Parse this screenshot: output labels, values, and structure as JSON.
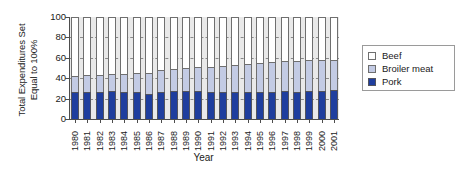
{
  "chart_data": {
    "type": "bar",
    "stacked": true,
    "title": "",
    "xlabel": "Year",
    "ylabel": "Total Expenditures Set Equal to 100%",
    "ylabel_line1": "Total Expenditures Set",
    "ylabel_line2": "Equal to 100%",
    "ylim": [
      0,
      100
    ],
    "yticks": [
      0,
      20,
      40,
      60,
      80,
      100
    ],
    "grid": true,
    "grid_style": "dashed-horizontal",
    "legend_position": "right",
    "categories": [
      "1980",
      "1981",
      "1982",
      "1983",
      "1984",
      "1985",
      "1986",
      "1987",
      "1988",
      "1989",
      "1990",
      "1991",
      "1992",
      "1993",
      "1994",
      "1995",
      "1996",
      "1997",
      "1998",
      "1999",
      "2000",
      "2001"
    ],
    "series": [
      {
        "name": "Pork",
        "color": "#1f3e9e",
        "values": [
          26,
          26,
          26,
          27,
          26,
          26,
          25,
          26,
          27,
          27,
          27,
          26,
          26,
          26,
          26,
          26,
          26,
          27,
          26,
          27,
          27,
          28
        ]
      },
      {
        "name": "Broiler meat",
        "color": "#c3cbe4",
        "values": [
          16,
          17,
          17,
          17,
          18,
          19,
          20,
          22,
          22,
          23,
          24,
          25,
          26,
          27,
          28,
          29,
          30,
          30,
          31,
          31,
          31,
          30
        ]
      },
      {
        "name": "Beef",
        "color": "#ffffff",
        "values": [
          58,
          57,
          57,
          56,
          56,
          55,
          55,
          52,
          51,
          50,
          49,
          49,
          48,
          47,
          46,
          45,
          44,
          43,
          43,
          42,
          42,
          42
        ]
      }
    ],
    "cumulative_tops": {
      "pork": [
        26,
        26,
        26,
        27,
        26,
        26,
        25,
        26,
        27,
        27,
        27,
        26,
        26,
        26,
        26,
        26,
        26,
        27,
        26,
        27,
        27,
        28
      ],
      "broiler": [
        42,
        43,
        43,
        44,
        44,
        45,
        45,
        48,
        49,
        50,
        51,
        51,
        52,
        53,
        54,
        55,
        56,
        57,
        57,
        58,
        58,
        58
      ],
      "beef": [
        100,
        100,
        100,
        100,
        100,
        100,
        100,
        100,
        100,
        100,
        100,
        100,
        100,
        100,
        100,
        100,
        100,
        100,
        100,
        100,
        100,
        100
      ]
    }
  },
  "legend": {
    "items": [
      {
        "label": "Beef",
        "swatch": "beef-swatch"
      },
      {
        "label": "Broiler meat",
        "swatch": "broiler-meat-swatch"
      },
      {
        "label": "Pork",
        "swatch": "pork-swatch"
      }
    ]
  },
  "colors": {
    "pork": "#1f3e9e",
    "broiler": "#c3cbe4",
    "beef": "#ffffff",
    "plot_background": "#e9e9e9",
    "axis": "#4d4d4d",
    "gridline": "#8a8a8a"
  }
}
